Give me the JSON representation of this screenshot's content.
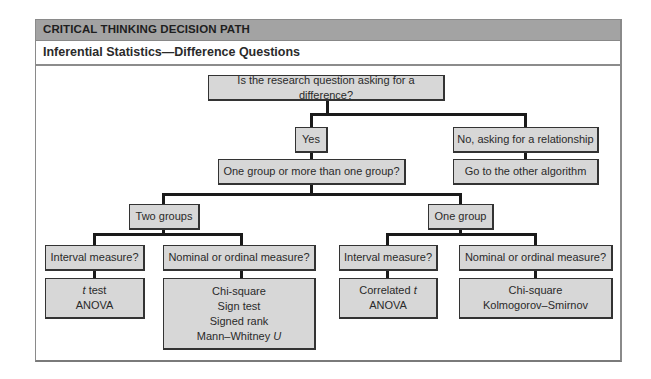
{
  "header": {
    "title": "CRITICAL THINKING DECISION PATH",
    "subtitle": "Inferential Statistics—Difference Questions"
  },
  "nodes": {
    "root": "Is the research question asking for a difference?",
    "yes": "Yes",
    "no": "No, asking for a relationship",
    "other_algorithm": "Go to the other algorithm",
    "group_question": "One group or more than one group?",
    "two_groups": "Two groups",
    "one_group": "One group",
    "two_interval": "Interval measure?",
    "two_nominal": "Nominal or ordinal measure?",
    "one_interval": "Interval measure?",
    "one_nominal": "Nominal or ordinal measure?"
  },
  "results": {
    "two_interval": [
      {
        "italic": "t",
        "text": " test"
      },
      {
        "italic": "",
        "text": "ANOVA"
      }
    ],
    "two_nominal": [
      {
        "italic": "",
        "text": "Chi-square"
      },
      {
        "italic": "",
        "text": "Sign test"
      },
      {
        "italic": "",
        "text": "Signed rank"
      },
      {
        "italic": "U",
        "text": "Mann–Whitney ",
        "italic_after": true
      }
    ],
    "one_interval": [
      {
        "italic": "t",
        "text": "Correlated ",
        "italic_after": true
      },
      {
        "italic": "",
        "text": "ANOVA"
      }
    ],
    "one_nominal": [
      {
        "italic": "",
        "text": "Chi-square"
      },
      {
        "italic": "",
        "text": "Kolmogorov–Smirnov"
      }
    ]
  }
}
